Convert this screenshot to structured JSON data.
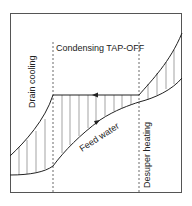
{
  "diagram": {
    "labels": {
      "condensing": "Condensing TAP-OFF",
      "drain_cooling": "Drain cooling",
      "desuper_heating": "Desuper heating",
      "feed_water": "Feed water"
    },
    "zones": [
      "Drain cooling",
      "Condensing TAP-OFF",
      "Desuper heating"
    ],
    "colors": {
      "line": "#222222",
      "hatch": "#555555",
      "dashed": "#444444",
      "background": "#ffffff"
    }
  }
}
